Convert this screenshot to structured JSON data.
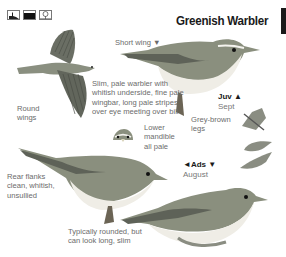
{
  "page": {
    "title": "Greenish Warbler",
    "habitat_icons": [
      {
        "name": "reedbed-icon"
      },
      {
        "name": "water-icon"
      },
      {
        "name": "tree-icon"
      }
    ]
  },
  "annotations": {
    "short_wing": "Short wing ▼",
    "description": [
      "Slim, pale warbler with",
      "whitish underside, fine pale",
      "wingbar, long pale stripes",
      "over eye meeting over bill"
    ],
    "round_wings": [
      "Round",
      "wings"
    ],
    "lower_mandible": [
      "Lower",
      "mandible",
      "all pale"
    ],
    "legs": [
      "Grey-brown",
      "legs"
    ],
    "rear_flanks": [
      "Rear flanks",
      "clean, whitish,",
      "unsullied"
    ],
    "shape": [
      "Typically rounded, but",
      "can look long, slim"
    ]
  },
  "ages": {
    "juv": {
      "tag": "Juv ▲",
      "month": "Sept"
    },
    "ads": {
      "tag": "◄Ads ▼",
      "month": "August"
    }
  },
  "colors": {
    "bird_back": "#8a8f7e",
    "bird_belly": "#eeece4",
    "wing_dark": "#5e6258",
    "text": "#6b6b6b",
    "title": "#1a1a1a"
  }
}
